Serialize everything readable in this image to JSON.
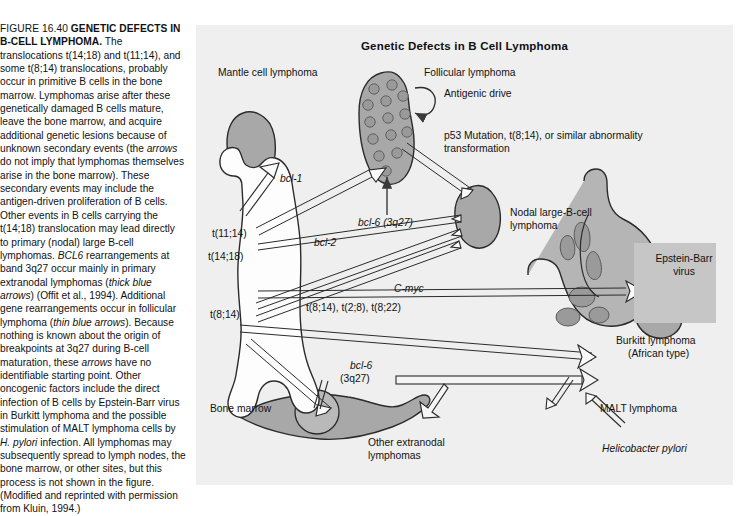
{
  "caption": {
    "figure_label": "FIGURE 16.40",
    "figure_title": "GENETIC DEFECTS IN B-CELL LYMPHOMA.",
    "body_html": " The translocations t(14;18) and t(11;14), and some t(8;14) translocations, probably occur in primitive B cells in the bone marrow. Lymphomas arise after these genetically damaged B cells mature, leave the bone marrow, and acquire additional genetic lesions because of unknown secondary events (the <i>arrows</i> do not imply that lymphomas themselves arise in the bone marrow). These secondary events may include the antigen-driven proliferation of B cells. Other events in B cells carrying the t(14;18) translocation may lead directly to primary (nodal) large B-cell lymphomas. <i>BCL6</i> rearrangements at band 3q27 occur mainly in primary extranodal lymphomas (<i>thick blue arrows</i>) (Offit et al., 1994). Additional gene rearrangements occur in follicular lymphoma (<i>thin blue arrows</i>). Because nothing is known about the origin of breakpoints at 3q27 during B-cell maturation, these <i>arrows</i> have no identifiable starting point. Other oncogenic factors include the direct infection of B cells by Epstein-Barr virus in Burkitt lymphoma and the possible stimulation of MALT lymphoma cells by <i>H. pylori</i> infection. All lymphomas may subsequently spread to lymph nodes, the bone marrow, or other sites, but this process is not shown in the figure. (Modified and reprinted with permission from Kluin, 1994.)"
  },
  "panel": {
    "title": "Genetic Defects in B Cell Lymphoma",
    "background_color": "#efefef",
    "shape_fill": "#a8a8a8",
    "shape_stroke": "#2b2b2b",
    "marrow_fill": "#fefefe",
    "ebv_band_color": "#c6c6c6"
  },
  "labels": {
    "mantle_cell": "Mantle cell lymphoma",
    "follicular": "Follicular lymphoma",
    "antigenic_drive": "Antigenic drive",
    "p53_line1": "p53 Mutation, t(8;14), or similar abnormality",
    "p53_line2": "transformation",
    "bcl1": "bcl-1",
    "bcl6_3q27_top": "bcl-6 (3q27)",
    "bcl2": "bcl-2",
    "cmyc": "C-myc",
    "t1114": "t(11;14)",
    "t1418": "t(14;18)",
    "t814": "t(8;14)",
    "translocation_list": "t(8;14), t(2;8), t(8;22)",
    "nodal_line1": "Nodal large-B-cell",
    "nodal_line2": "lymphoma",
    "ebv_line1": "Epstein-Barr",
    "ebv_line2": "virus",
    "burkitt_line1": "Burkitt lymphoma",
    "burkitt_line2": "(African type)",
    "bone_marrow": "Bone marrow",
    "bcl6_line1": "bcl-6",
    "bcl6_line2": "(3q27)",
    "other_extranodal_line1": "Other extranodal",
    "other_extranodal_line2": "lymphomas",
    "malt": "MALT lymphoma",
    "h_pylori": "Helicobacter pylori"
  }
}
